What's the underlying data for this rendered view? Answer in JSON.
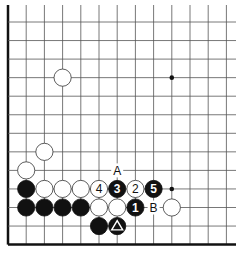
{
  "diagram": {
    "type": "go-board-corner",
    "grid": {
      "origin_x": 8,
      "origin_y": 22,
      "step_x": 18.2,
      "step_y": 18.55,
      "columns": 13,
      "rows": 13,
      "top_open_y": 5,
      "right_open_x": 236,
      "edges": [
        "left",
        "bottom"
      ]
    },
    "colors": {
      "line": "#555555",
      "edge": "#111111",
      "black_stone": "#111111",
      "white_stone": "#ffffff",
      "stone_outline": "#333333"
    },
    "hoshi": [
      {
        "col": 9,
        "row": 3
      },
      {
        "col": 9,
        "row": 9
      }
    ],
    "stones": [
      {
        "color": "white",
        "col": 3,
        "row": 3,
        "label": ""
      },
      {
        "color": "white",
        "col": 2,
        "row": 7,
        "label": ""
      },
      {
        "color": "white",
        "col": 1,
        "row": 8,
        "label": ""
      },
      {
        "color": "black",
        "col": 1,
        "row": 9,
        "label": ""
      },
      {
        "color": "white",
        "col": 2,
        "row": 9,
        "label": ""
      },
      {
        "color": "white",
        "col": 3,
        "row": 9,
        "label": ""
      },
      {
        "color": "white",
        "col": 4,
        "row": 9,
        "label": ""
      },
      {
        "color": "white",
        "col": 5,
        "row": 9,
        "label": "4"
      },
      {
        "color": "black",
        "col": 6,
        "row": 9,
        "label": "3"
      },
      {
        "color": "white",
        "col": 7,
        "row": 9,
        "label": "2"
      },
      {
        "color": "black",
        "col": 8,
        "row": 9,
        "label": "5"
      },
      {
        "color": "black",
        "col": 1,
        "row": 10,
        "label": ""
      },
      {
        "color": "black",
        "col": 2,
        "row": 10,
        "label": ""
      },
      {
        "color": "black",
        "col": 3,
        "row": 10,
        "label": ""
      },
      {
        "color": "black",
        "col": 4,
        "row": 10,
        "label": ""
      },
      {
        "color": "white",
        "col": 5,
        "row": 10,
        "label": ""
      },
      {
        "color": "white",
        "col": 6,
        "row": 10,
        "label": ""
      },
      {
        "color": "black",
        "col": 7,
        "row": 10,
        "label": "1"
      },
      {
        "color": "white",
        "col": 9,
        "row": 10,
        "label": ""
      },
      {
        "color": "black",
        "col": 5,
        "row": 11,
        "label": ""
      },
      {
        "color": "black",
        "col": 6,
        "row": 11,
        "label": "",
        "marker": "triangle"
      }
    ],
    "letters": [
      {
        "text": "A",
        "col": 6,
        "row": 8
      },
      {
        "text": "B",
        "col": 8,
        "row": 10
      }
    ]
  }
}
